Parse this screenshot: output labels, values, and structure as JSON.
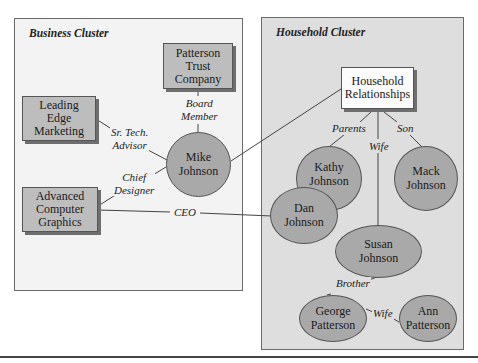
{
  "clusters": {
    "business": {
      "title": "Business Cluster"
    },
    "household": {
      "title": "Household Cluster"
    }
  },
  "entities": {
    "patterson_trust": "Patterson\nTrust\nCompany",
    "leading_edge": "Leading\nEdge\nMarketing",
    "advanced_computer": "Advanced\nComputer\nGraphics",
    "household_relationships": "Household\nRelationships"
  },
  "people": {
    "mike": "Mike\nJohnson",
    "kathy": "Kathy\nJohnson",
    "dan": "Dan\nJohnson",
    "mack": "Mack\nJohnson",
    "susan": "Susan\nJohnson",
    "george": "George\nPatterson",
    "ann": "Ann\nPatterson"
  },
  "relationships": {
    "board_member": "Board\nMember",
    "sr_tech_advisor": "Sr. Tech.\nAdvisor",
    "chief_designer": "Chief\nDesigner",
    "ceo": "CEO",
    "parents": "Parents",
    "wife_household": "Wife",
    "son": "Son",
    "brother": "Brother",
    "wife_george": "Wife"
  },
  "colors": {
    "business_bg": "#f3f3f3",
    "household_bg": "#dedede",
    "entity_box": "#bdbdbd",
    "person_node": "#a9a9a9",
    "line": "#444444"
  }
}
